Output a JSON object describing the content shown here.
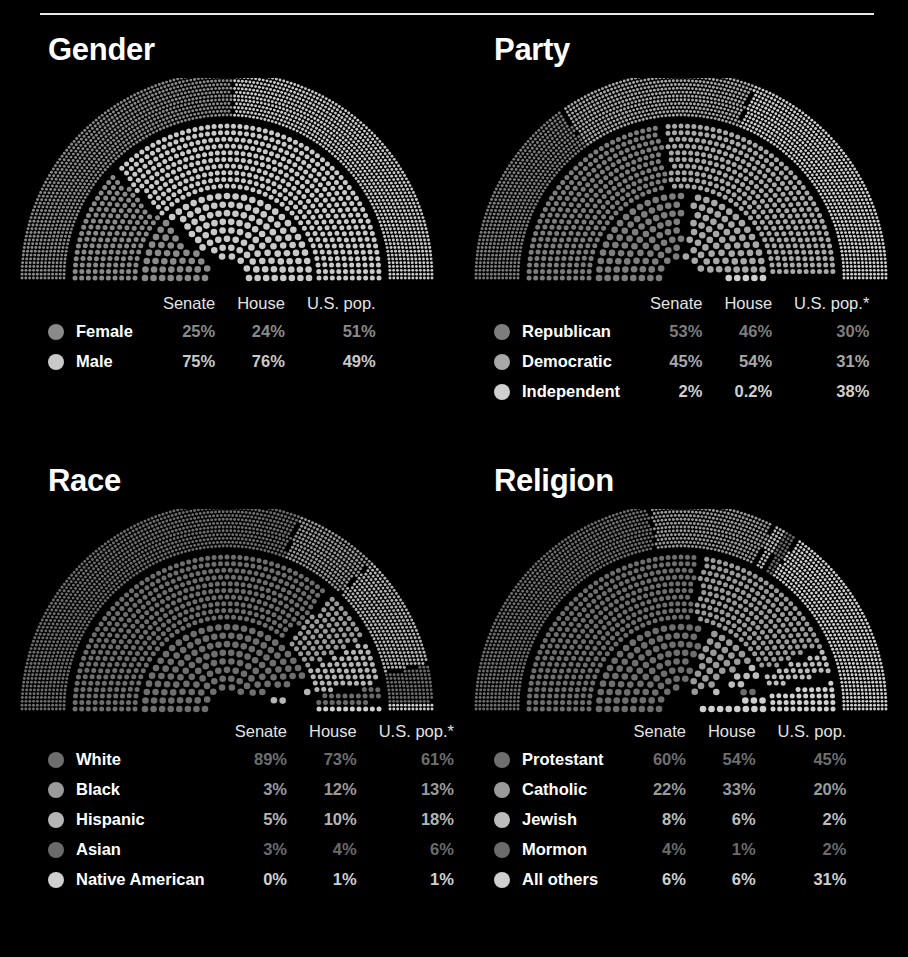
{
  "page": {
    "background": "#000000",
    "rule_color": "#e8e8e8",
    "title_color": "#ffffff"
  },
  "columns": [
    "Senate",
    "House",
    "U.S. pop."
  ],
  "panels": [
    {
      "id": "gender",
      "title": "Gender",
      "headers": {
        "name": "",
        "senate": "Senate",
        "house": "House",
        "pop": "U.S. pop."
      },
      "rows": [
        {
          "label": "Female",
          "color": "#8a8a8a",
          "senate": "25%",
          "house": "24%",
          "pop": "51%"
        },
        {
          "label": "Male",
          "color": "#c9c9c9",
          "senate": "75%",
          "house": "76%",
          "pop": "49%"
        }
      ]
    },
    {
      "id": "party",
      "title": "Party",
      "headers": {
        "name": "",
        "senate": "Senate",
        "house": "House",
        "pop": "U.S. pop.*"
      },
      "rows": [
        {
          "label": "Republican",
          "color": "#7d7d7d",
          "senate": "53%",
          "house": "46%",
          "pop": "30%"
        },
        {
          "label": "Democratic",
          "color": "#a8a8a8",
          "senate": "45%",
          "house": "54%",
          "pop": "31%"
        },
        {
          "label": "Independent",
          "color": "#cfcfcf",
          "senate": "2%",
          "house": "0.2%",
          "pop": "38%"
        }
      ]
    },
    {
      "id": "race",
      "title": "Race",
      "headers": {
        "name": "",
        "senate": "Senate",
        "house": "House",
        "pop": "U.S. pop.*"
      },
      "rows": [
        {
          "label": "White",
          "color": "#6e6e6e",
          "senate": "89%",
          "house": "73%",
          "pop": "61%"
        },
        {
          "label": "Black",
          "color": "#9a9a9a",
          "senate": "3%",
          "house": "12%",
          "pop": "13%"
        },
        {
          "label": "Hispanic",
          "color": "#b5b5b5",
          "senate": "5%",
          "house": "10%",
          "pop": "18%"
        },
        {
          "label": "Asian",
          "color": "#6b6b6b",
          "senate": "3%",
          "house": "4%",
          "pop": "6%"
        },
        {
          "label": "Native American",
          "color": "#cfcfcf",
          "senate": "0%",
          "house": "1%",
          "pop": "1%"
        }
      ]
    },
    {
      "id": "religion",
      "title": "Religion",
      "headers": {
        "name": "",
        "senate": "Senate",
        "house": "House",
        "pop": "U.S. pop."
      },
      "rows": [
        {
          "label": "Protestant",
          "color": "#6e6e6e",
          "senate": "60%",
          "house": "54%",
          "pop": "45%"
        },
        {
          "label": "Catholic",
          "color": "#9a9a9a",
          "senate": "22%",
          "house": "33%",
          "pop": "20%"
        },
        {
          "label": "Jewish",
          "color": "#bcbcbc",
          "senate": "8%",
          "house": "6%",
          "pop": "2%"
        },
        {
          "label": "Mormon",
          "color": "#6b6b6b",
          "senate": "4%",
          "house": "1%",
          "pop": "2%"
        },
        {
          "label": "All others",
          "color": "#cfcfcf",
          "senate": "6%",
          "house": "6%",
          "pop": "31%"
        }
      ]
    }
  ],
  "chart_data": [
    {
      "type": "pie",
      "title": "Gender",
      "subtype": "nested-semicircle-dot-arc",
      "rings": [
        "Senate",
        "House",
        "U.S. pop."
      ],
      "categories": [
        "Female",
        "Male"
      ],
      "series": [
        {
          "name": "Senate",
          "values": [
            25,
            75
          ]
        },
        {
          "name": "House",
          "values": [
            24,
            76
          ]
        },
        {
          "name": "U.S. pop.",
          "values": [
            51,
            49
          ]
        }
      ],
      "legend": "below"
    },
    {
      "type": "pie",
      "title": "Party",
      "subtype": "nested-semicircle-dot-arc",
      "rings": [
        "Senate",
        "House",
        "U.S. pop.*"
      ],
      "categories": [
        "Republican",
        "Democratic",
        "Independent"
      ],
      "series": [
        {
          "name": "Senate",
          "values": [
            53,
            45,
            2
          ]
        },
        {
          "name": "House",
          "values": [
            46,
            54,
            0.2
          ]
        },
        {
          "name": "U.S. pop.*",
          "values": [
            30,
            31,
            38
          ]
        }
      ],
      "legend": "below"
    },
    {
      "type": "pie",
      "title": "Race",
      "subtype": "nested-semicircle-dot-arc",
      "rings": [
        "Senate",
        "House",
        "U.S. pop.*"
      ],
      "categories": [
        "White",
        "Black",
        "Hispanic",
        "Asian",
        "Native American"
      ],
      "series": [
        {
          "name": "Senate",
          "values": [
            89,
            3,
            5,
            3,
            0
          ]
        },
        {
          "name": "House",
          "values": [
            73,
            12,
            10,
            4,
            1
          ]
        },
        {
          "name": "U.S. pop.*",
          "values": [
            61,
            13,
            18,
            6,
            1
          ]
        }
      ],
      "legend": "below"
    },
    {
      "type": "pie",
      "title": "Religion",
      "subtype": "nested-semicircle-dot-arc",
      "rings": [
        "Senate",
        "House",
        "U.S. pop."
      ],
      "categories": [
        "Protestant",
        "Catholic",
        "Jewish",
        "Mormon",
        "All others"
      ],
      "series": [
        {
          "name": "Senate",
          "values": [
            60,
            22,
            8,
            4,
            6
          ]
        },
        {
          "name": "House",
          "values": [
            54,
            33,
            6,
            1,
            6
          ]
        },
        {
          "name": "U.S. pop.",
          "values": [
            45,
            20,
            2,
            2,
            31
          ]
        }
      ],
      "legend": "below"
    }
  ]
}
